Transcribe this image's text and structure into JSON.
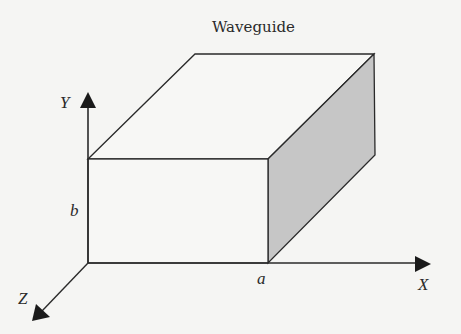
{
  "diagram": {
    "title": "Waveguide",
    "type": "rectangular waveguide 3D box with coordinate axes",
    "axes": {
      "x_label": "X",
      "y_label": "Y",
      "z_label": "Z"
    },
    "dimensions": {
      "width_label": "a",
      "height_label": "b"
    },
    "colors": {
      "line": "#2a2a2a",
      "side_face_fill": "#c6c6c6",
      "front_face_fill": "#f7f7f5",
      "top_face_fill": "#f7f7f5",
      "background": "#f5f5f3"
    }
  }
}
